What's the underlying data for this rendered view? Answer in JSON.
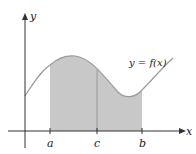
{
  "diagram": {
    "type": "area-under-curve",
    "curve_label": "y = f(x)",
    "axes": {
      "x_label": "x",
      "y_label": "y"
    },
    "ticks": [
      {
        "label": "a",
        "x": 50
      },
      {
        "label": "c",
        "x": 97
      },
      {
        "label": "b",
        "x": 142
      }
    ],
    "colors": {
      "shade": "#c8c8c8",
      "curve": "#9a9a9a",
      "axis": "#333333",
      "tick_line": "#7a7a7a"
    }
  }
}
